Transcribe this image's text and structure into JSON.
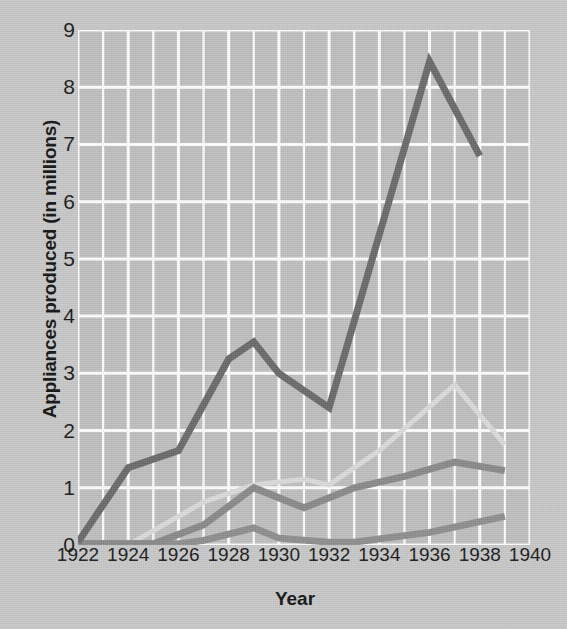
{
  "chart_data": {
    "type": "line",
    "title": "",
    "xlabel": "Year",
    "ylabel": "Appliances produced (in millions)",
    "xlim": [
      1922,
      1940
    ],
    "ylim": [
      0,
      9
    ],
    "xticks": [
      1922,
      1924,
      1926,
      1928,
      1930,
      1932,
      1934,
      1936,
      1938,
      1940
    ],
    "yticks": [
      0,
      1,
      2,
      3,
      4,
      5,
      6,
      7,
      8,
      9
    ],
    "grid": true,
    "grid_color": "#ffffff",
    "plot_background": "#c0c0c0",
    "legend": "none",
    "x": [
      1922,
      1923,
      1924,
      1925,
      1926,
      1927,
      1928,
      1929,
      1930,
      1931,
      1932,
      1933,
      1934,
      1935,
      1936,
      1937,
      1938,
      1939
    ],
    "series": [
      {
        "name": "series-1-dark",
        "color": "#6b6b6b",
        "linewidth": 7,
        "x": [
          1922,
          1924,
          1926,
          1928,
          1929,
          1930,
          1932,
          1936,
          1938
        ],
        "values": [
          0.05,
          1.35,
          1.65,
          3.25,
          3.55,
          3.0,
          2.4,
          8.45,
          6.8
        ]
      },
      {
        "name": "series-2-medium",
        "color": "#8a8a8a",
        "linewidth": 7,
        "x": [
          1922,
          1925,
          1927,
          1929,
          1931,
          1933,
          1935,
          1937,
          1939
        ],
        "values": [
          0.02,
          0.02,
          0.35,
          1.0,
          0.65,
          1.0,
          1.2,
          1.45,
          1.3
        ]
      },
      {
        "name": "series-3-lower",
        "color": "#8f8f8f",
        "linewidth": 7,
        "x": [
          1922,
          1926,
          1927,
          1929,
          1930,
          1932,
          1933,
          1936,
          1939
        ],
        "values": [
          0.02,
          0.02,
          0.08,
          0.3,
          0.12,
          0.05,
          0.05,
          0.22,
          0.5
        ]
      },
      {
        "name": "series-4-light",
        "color": "#dcdcdc",
        "linewidth": 5,
        "x": [
          1924,
          1925,
          1927,
          1929,
          1930,
          1931,
          1932,
          1934,
          1937,
          1939
        ],
        "values": [
          0.0,
          0.25,
          0.75,
          1.05,
          1.1,
          1.15,
          1.05,
          1.65,
          2.8,
          1.75
        ]
      }
    ]
  },
  "axis": {
    "y_title": "Appliances produced (in millions)",
    "x_title": "Year",
    "y_labels": [
      "9",
      "8",
      "7",
      "6",
      "5",
      "4",
      "3",
      "2",
      "1",
      "0"
    ],
    "x_labels": [
      "1922",
      "1924",
      "1926",
      "1928",
      "1930",
      "1932",
      "1934",
      "1936",
      "1938",
      "1940"
    ]
  }
}
